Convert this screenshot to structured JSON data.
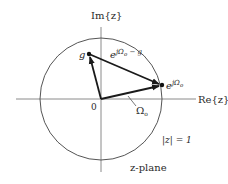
{
  "diagram": {
    "title": "z-plane",
    "axes": {
      "real_label": "Re{z}",
      "imag_label": "Im{z}",
      "origin_label": "0"
    },
    "unit_circle_label": "|z| = 1",
    "points": {
      "g": {
        "label": "g"
      },
      "e": {
        "label_base": "e",
        "label_exp": "jΩ",
        "label_sub": "o"
      }
    },
    "vectors": {
      "difference": {
        "label_base": "e",
        "label_exp": "jΩ",
        "label_sub": "o",
        "label_tail": " − g"
      },
      "angle": {
        "label": "Ω",
        "label_sub": "o"
      }
    },
    "colors": {
      "line": "#2a2a2a",
      "axis": "#888888",
      "circle": "#555555"
    }
  }
}
